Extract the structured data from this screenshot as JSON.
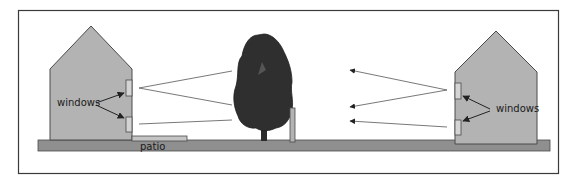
{
  "diagram": {
    "labels": {
      "left_windows": "windows",
      "right_windows": "windows",
      "patio": "patio"
    },
    "colors": {
      "frame": "#3a3a3a",
      "house_fill": "#b3b3b3",
      "house_stroke": "#4a4a4a",
      "ground": "#8f8f8f",
      "patio": "#c4c4c4",
      "tree": "#2f2f2f",
      "window_fill": "#d4d4d4",
      "line": "#555555",
      "background": "#ffffff"
    }
  }
}
